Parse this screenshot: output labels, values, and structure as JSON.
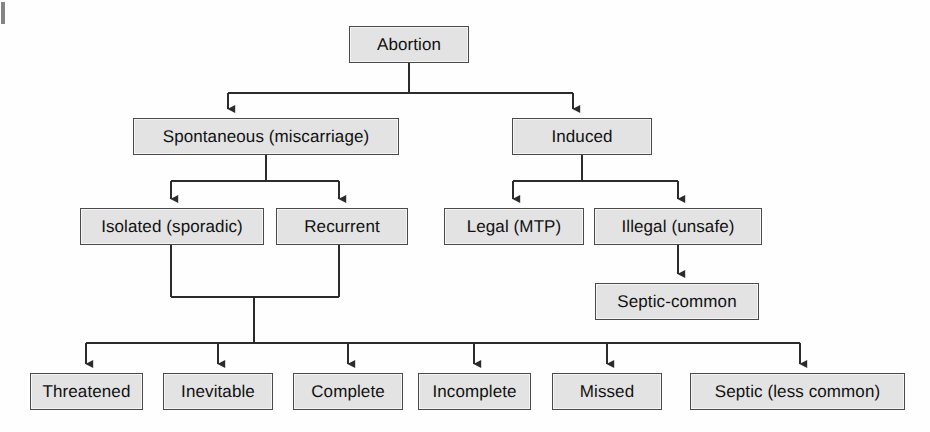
{
  "diagram": {
    "type": "tree-flowchart",
    "background_color": "#fefefe",
    "box_fill_color": "#e3e3e3",
    "box_border_color": "#4a4a4a",
    "connector_color": "#2b2b2b",
    "text_color": "#111111",
    "nodes": [
      {
        "id": "abortion",
        "label": "Abortion",
        "x": 349,
        "y": 26,
        "w": 120,
        "h": 37,
        "level": 0
      },
      {
        "id": "spontaneous",
        "label": "Spontaneous (miscarriage)",
        "x": 133,
        "y": 118,
        "w": 266,
        "h": 37,
        "level": 1
      },
      {
        "id": "induced",
        "label": "Induced",
        "x": 512,
        "y": 118,
        "w": 140,
        "h": 37,
        "level": 1
      },
      {
        "id": "isolated",
        "label": "Isolated (sporadic)",
        "x": 80,
        "y": 208,
        "w": 184,
        "h": 37,
        "level": 2
      },
      {
        "id": "recurrent",
        "label": "Recurrent",
        "x": 276,
        "y": 208,
        "w": 132,
        "h": 37,
        "level": 2
      },
      {
        "id": "legal",
        "label": "Legal (MTP)",
        "x": 444,
        "y": 208,
        "w": 140,
        "h": 37,
        "level": 2
      },
      {
        "id": "illegal",
        "label": "Illegal (unsafe)",
        "x": 594,
        "y": 208,
        "w": 168,
        "h": 37,
        "level": 2
      },
      {
        "id": "septic-common",
        "label": "Septic-common",
        "x": 595,
        "y": 283,
        "w": 164,
        "h": 37,
        "level": 3
      },
      {
        "id": "threatened",
        "label": "Threatened",
        "x": 30,
        "y": 373,
        "w": 113,
        "h": 37,
        "level": 4
      },
      {
        "id": "inevitable",
        "label": "Inevitable",
        "x": 163,
        "y": 373,
        "w": 110,
        "h": 37,
        "level": 4
      },
      {
        "id": "complete",
        "label": "Complete",
        "x": 293,
        "y": 373,
        "w": 110,
        "h": 37,
        "level": 4
      },
      {
        "id": "incomplete",
        "label": "Incomplete",
        "x": 418,
        "y": 373,
        "w": 113,
        "h": 37,
        "level": 4
      },
      {
        "id": "missed",
        "label": "Missed",
        "x": 552,
        "y": 373,
        "w": 110,
        "h": 37,
        "level": 4
      },
      {
        "id": "septic-less",
        "label": "Septic (less common)",
        "x": 690,
        "y": 373,
        "w": 215,
        "h": 37,
        "level": 4
      }
    ],
    "edges": [
      {
        "from": "abortion",
        "to": "spontaneous",
        "style": "elbow-down",
        "arrow": true
      },
      {
        "from": "abortion",
        "to": "induced",
        "style": "elbow-down",
        "arrow": true
      },
      {
        "from": "spontaneous",
        "to": "isolated",
        "style": "elbow-down",
        "arrow": true
      },
      {
        "from": "spontaneous",
        "to": "recurrent",
        "style": "elbow-down",
        "arrow": true
      },
      {
        "from": "induced",
        "to": "legal",
        "style": "elbow-down",
        "arrow": true
      },
      {
        "from": "induced",
        "to": "illegal",
        "style": "elbow-down",
        "arrow": true
      },
      {
        "from": "illegal",
        "to": "septic-common",
        "style": "straight-down",
        "arrow": true
      },
      {
        "from": "isolated",
        "to": "bottom-bus",
        "style": "merge-down",
        "arrow": false
      },
      {
        "from": "recurrent",
        "to": "bottom-bus",
        "style": "merge-down",
        "arrow": false
      },
      {
        "from": "bottom-bus",
        "to": "threatened",
        "style": "elbow-down",
        "arrow": true
      },
      {
        "from": "bottom-bus",
        "to": "inevitable",
        "style": "elbow-down",
        "arrow": true
      },
      {
        "from": "bottom-bus",
        "to": "complete",
        "style": "elbow-down",
        "arrow": true
      },
      {
        "from": "bottom-bus",
        "to": "incomplete",
        "style": "elbow-down",
        "arrow": true
      },
      {
        "from": "bottom-bus",
        "to": "missed",
        "style": "elbow-down",
        "arrow": true
      },
      {
        "from": "bottom-bus",
        "to": "septic-less",
        "style": "elbow-down",
        "arrow": true
      }
    ]
  }
}
